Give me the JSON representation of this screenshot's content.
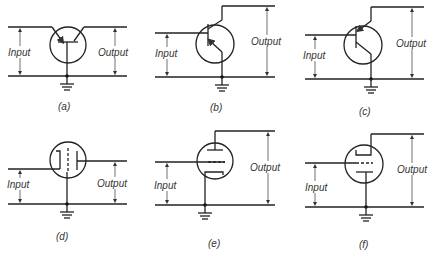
{
  "figure": {
    "panels": [
      {
        "id": "a",
        "caption": "(a)",
        "device": "pnp-transistor-common-base",
        "input_label": "Input",
        "output_label": "Output"
      },
      {
        "id": "b",
        "caption": "(b)",
        "device": "pnp-transistor-common-emitter",
        "input_label": "Input",
        "output_label": "Output"
      },
      {
        "id": "c",
        "caption": "(c)",
        "device": "pnp-transistor-common-collector",
        "input_label": "Input",
        "output_label": "Output"
      },
      {
        "id": "d",
        "caption": "(d)",
        "device": "triode-grounded-grid",
        "input_label": "Input",
        "output_label": "Output"
      },
      {
        "id": "e",
        "caption": "(e)",
        "device": "triode-grounded-cathode",
        "input_label": "Input",
        "output_label": "Output"
      },
      {
        "id": "f",
        "caption": "(f)",
        "device": "triode-grounded-plate",
        "input_label": "Input",
        "output_label": "Output"
      }
    ]
  }
}
